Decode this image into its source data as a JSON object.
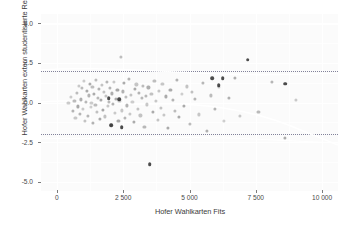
{
  "chart_data": {
    "type": "scatter",
    "title": "",
    "xlabel": "Hofer Wahlkarten Fits",
    "ylabel": "Hofer Wahlkarten extern studentisierte Residuen",
    "xlim": [
      -600,
      10600
    ],
    "ylim": [
      -5.6,
      5.6
    ],
    "xticks": [
      0,
      2500,
      5000,
      7500,
      10000
    ],
    "xticklabels": [
      "0",
      "2 500",
      "5 000",
      "7 500",
      "10 000"
    ],
    "yticks": [
      -5.0,
      -2.5,
      0.0,
      2.5,
      5.0
    ],
    "yticklabels": [
      "-5.0",
      "-2.5",
      "0.0",
      "2.5",
      "5.0"
    ],
    "grid": true,
    "legend": null,
    "point_color": "#2b2b2b",
    "panel_color": "#fbfbfb",
    "gridline_color": "#ffffff",
    "refline_color": "#6e6e8a",
    "reflines": [
      2.0,
      -2.0
    ],
    "points": [
      [
        430,
        -0.05
      ],
      [
        520,
        0.35
      ],
      [
        610,
        -0.55
      ],
      [
        660,
        0.1
      ],
      [
        700,
        -0.95
      ],
      [
        760,
        0.62
      ],
      [
        800,
        -0.25
      ],
      [
        840,
        1.05
      ],
      [
        880,
        -0.7
      ],
      [
        910,
        0.2
      ],
      [
        950,
        0.9
      ],
      [
        980,
        -0.4
      ],
      [
        1010,
        1.35
      ],
      [
        1050,
        -1.15
      ],
      [
        1090,
        0.05
      ],
      [
        1130,
        0.75
      ],
      [
        1170,
        -0.85
      ],
      [
        1200,
        0.45
      ],
      [
        1240,
        1.2
      ],
      [
        1270,
        -0.3
      ],
      [
        1300,
        0.0
      ],
      [
        1340,
        0.98
      ],
      [
        1370,
        -1.3
      ],
      [
        1410,
        0.55
      ],
      [
        1450,
        -0.15
      ],
      [
        1480,
        1.45
      ],
      [
        1520,
        -0.62
      ],
      [
        1550,
        0.3
      ],
      [
        1590,
        0.85
      ],
      [
        1620,
        -1.05
      ],
      [
        1660,
        0.15
      ],
      [
        1700,
        1.1
      ],
      [
        1740,
        -0.45
      ],
      [
        1780,
        0.68
      ],
      [
        1810,
        -0.88
      ],
      [
        1850,
        0.4
      ],
      [
        1890,
        1.28
      ],
      [
        1920,
        -0.22
      ],
      [
        1960,
        0.05
      ],
      [
        2000,
        0.92
      ],
      [
        2040,
        -1.42
      ],
      [
        2080,
        0.58
      ],
      [
        2120,
        -0.08
      ],
      [
        2160,
        1.32
      ],
      [
        2200,
        -0.68
      ],
      [
        2240,
        0.25
      ],
      [
        2280,
        0.8
      ],
      [
        2320,
        -1.18
      ],
      [
        2360,
        0.12
      ],
      [
        2400,
        2.9
      ],
      [
        2440,
        -0.5
      ],
      [
        2480,
        0.7
      ],
      [
        2520,
        1.22
      ],
      [
        2560,
        -0.95
      ],
      [
        2600,
        0.35
      ],
      [
        2650,
        -0.18
      ],
      [
        2700,
        1.48
      ],
      [
        2750,
        -0.72
      ],
      [
        2800,
        0.48
      ],
      [
        2850,
        0.02
      ],
      [
        2900,
        -1.25
      ],
      [
        2950,
        0.88
      ],
      [
        3000,
        1.15
      ],
      [
        3050,
        -0.38
      ],
      [
        3100,
        0.6
      ],
      [
        3150,
        -0.82
      ],
      [
        3200,
        0.28
      ],
      [
        3250,
        1.05
      ],
      [
        3300,
        -1.52
      ],
      [
        3350,
        0.42
      ],
      [
        3400,
        -0.12
      ],
      [
        3450,
        0.95
      ],
      [
        3500,
        -3.9
      ],
      [
        3560,
        0.52
      ],
      [
        3620,
        -0.62
      ],
      [
        3680,
        1.38
      ],
      [
        3740,
        0.08
      ],
      [
        3800,
        -1.08
      ],
      [
        3860,
        0.72
      ],
      [
        3920,
        -0.32
      ],
      [
        3980,
        1.18
      ],
      [
        4050,
        -0.78
      ],
      [
        4120,
        0.38
      ],
      [
        4200,
        -1.62
      ],
      [
        4280,
        0.82
      ],
      [
        4360,
        0.18
      ],
      [
        4440,
        -0.52
      ],
      [
        4520,
        1.42
      ],
      [
        4600,
        -0.92
      ],
      [
        4700,
        0.55
      ],
      [
        4800,
        -0.22
      ],
      [
        4900,
        1.02
      ],
      [
        5000,
        -1.35
      ],
      [
        5100,
        0.65
      ],
      [
        5200,
        0.22
      ],
      [
        5350,
        -0.75
      ],
      [
        5500,
        1.25
      ],
      [
        5650,
        -1.78
      ],
      [
        5800,
        0.45
      ],
      [
        5950,
        -0.42
      ],
      [
        6100,
        0.98
      ],
      [
        6300,
        -1.15
      ],
      [
        6500,
        0.3
      ],
      [
        6700,
        1.55
      ],
      [
        6900,
        -0.85
      ],
      [
        7200,
        2.7
      ],
      [
        7600,
        -0.58
      ],
      [
        8100,
        1.32
      ],
      [
        8600,
        -2.25
      ],
      [
        9000,
        0.15
      ]
    ],
    "emphasized_points": [
      [
        5850,
        1.52
      ],
      [
        6250,
        1.52
      ],
      [
        6100,
        1.1
      ],
      [
        7200,
        2.7
      ],
      [
        8600,
        1.18
      ],
      [
        2450,
        -1.55
      ],
      [
        3500,
        -3.9
      ],
      [
        2050,
        -1.45
      ],
      [
        1950,
        0.28
      ],
      [
        2350,
        0.22
      ]
    ]
  }
}
